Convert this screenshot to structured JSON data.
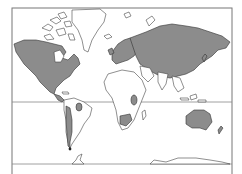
{
  "map": {
    "projection": "world-mercator-outline",
    "colors": {
      "shaded_land": "#8c8c8c",
      "unshaded_land": "#ffffff",
      "outline": "#333333",
      "frame": "#777777",
      "background": "#ffffff"
    },
    "reference_lines": [
      "equator",
      "southern-boundary"
    ],
    "shaded_regions": [
      "north-america",
      "europe",
      "asia",
      "central-andes-south-america",
      "central-africa",
      "southern-africa",
      "australia",
      "new-zealand"
    ],
    "unshaded_regions": [
      "greenland",
      "arctic-archipelago",
      "northern-africa",
      "most-of-south-america",
      "arabia",
      "southeast-asia-islands",
      "antarctica"
    ]
  }
}
